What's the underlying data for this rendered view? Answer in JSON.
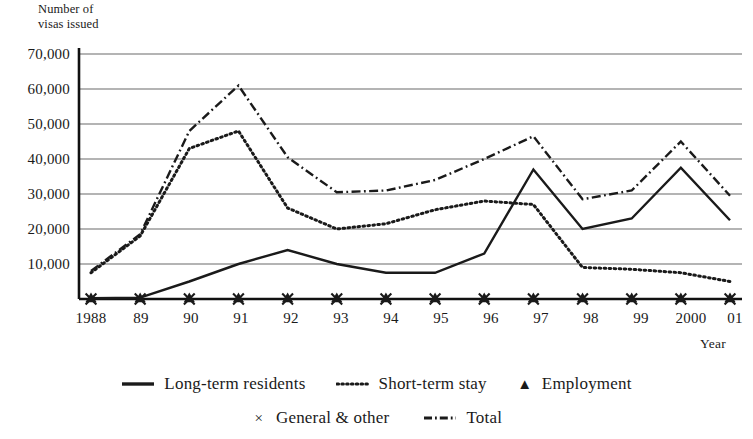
{
  "axis": {
    "y_title": "Number of\nvisas issued",
    "x_title": "Year",
    "y_ticks": [
      "70,000",
      "60,000",
      "50,000",
      "40,000",
      "30,000",
      "20,000",
      "10,000"
    ],
    "x_ticks": [
      "1988",
      "89",
      "90",
      "91",
      "92",
      "93",
      "94",
      "95",
      "96",
      "97",
      "98",
      "99",
      "2000",
      "01"
    ]
  },
  "legend": {
    "row1": [
      {
        "label": "Long-term residents",
        "style": "solid",
        "marker": ""
      },
      {
        "label": "Short-term stay",
        "style": "dotted",
        "marker": ""
      },
      {
        "label": "Employment",
        "style": "marker",
        "marker": "▲"
      }
    ],
    "row2": [
      {
        "label": "General & other",
        "style": "marker",
        "marker": "×"
      },
      {
        "label": "Total",
        "style": "dashdot",
        "marker": ""
      }
    ]
  },
  "colors": {
    "ink": "#1a1a1a",
    "gridline": "#6b6b6b",
    "axis": "#111111",
    "background": "#ffffff"
  },
  "chart_data": {
    "type": "line",
    "title": "",
    "xlabel": "Year",
    "ylabel": "Number of visas issued",
    "categories": [
      "1988",
      "89",
      "90",
      "91",
      "92",
      "93",
      "94",
      "95",
      "96",
      "97",
      "98",
      "99",
      "2000",
      "01"
    ],
    "ylim": [
      0,
      70000
    ],
    "ytick_interval": 10000,
    "grid": true,
    "legend_position": "bottom",
    "series": [
      {
        "name": "Long-term residents",
        "style": "solid",
        "values": [
          200,
          400,
          5000,
          10000,
          14000,
          10000,
          7500,
          7500,
          13000,
          37000,
          20000,
          23000,
          37500,
          22500
        ]
      },
      {
        "name": "Short-term stay",
        "style": "dotted",
        "values": [
          7500,
          18000,
          43000,
          48000,
          26000,
          20000,
          21500,
          25500,
          28000,
          27000,
          9000,
          8500,
          7500,
          5000
        ]
      },
      {
        "name": "Employment",
        "style": "marker",
        "marker": "triangle",
        "values": [
          0,
          0,
          0,
          0,
          0,
          0,
          0,
          0,
          0,
          0,
          0,
          0,
          0,
          0
        ]
      },
      {
        "name": "General & other",
        "style": "marker",
        "marker": "cross",
        "values": [
          0,
          0,
          0,
          0,
          0,
          0,
          0,
          0,
          0,
          0,
          0,
          0,
          0,
          0
        ]
      },
      {
        "name": "Total",
        "style": "dashdot",
        "values": [
          8000,
          18500,
          48000,
          61000,
          40500,
          30500,
          31000,
          34000,
          40000,
          46500,
          28500,
          31000,
          45000,
          29500
        ]
      }
    ]
  }
}
